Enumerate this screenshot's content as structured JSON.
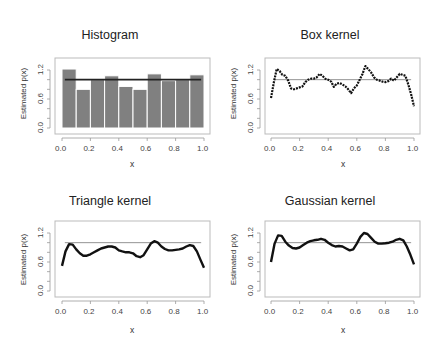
{
  "chart_data": [
    {
      "type": "bar",
      "title": "Histogram",
      "xlabel": "x",
      "ylabel": "Estimated p(x)",
      "xlim": [
        0.0,
        1.0
      ],
      "ylim": [
        0.0,
        1.4
      ],
      "xticks": [
        "0.0",
        "0.2",
        "0.4",
        "0.6",
        "0.8",
        "1.0"
      ],
      "yticks": [
        "0.0",
        "0.6",
        "1.2"
      ],
      "bin_edges": [
        0.0,
        0.1,
        0.2,
        0.3,
        0.4,
        0.5,
        0.6,
        0.7,
        0.8,
        0.9,
        1.0
      ],
      "values": [
        1.22,
        0.8,
        1.0,
        1.08,
        0.86,
        0.8,
        1.12,
        0.98,
        1.0,
        1.1
      ],
      "reference_line": 1.0,
      "bar_color": "#808080",
      "grid": false
    },
    {
      "type": "line",
      "title": "Box kernel",
      "xlabel": "x",
      "ylabel": "Estimated p(x)",
      "xlim": [
        0.0,
        1.0
      ],
      "ylim": [
        0.0,
        1.4
      ],
      "xticks": [
        "0.0",
        "0.2",
        "0.4",
        "0.6",
        "0.8",
        "1.0"
      ],
      "yticks": [
        "0.0",
        "0.6",
        "1.2"
      ],
      "reference_line": 1.0,
      "x": [
        0.0,
        0.02,
        0.04,
        0.06,
        0.08,
        0.1,
        0.12,
        0.14,
        0.16,
        0.18,
        0.2,
        0.22,
        0.24,
        0.26,
        0.28,
        0.3,
        0.32,
        0.34,
        0.36,
        0.38,
        0.4,
        0.42,
        0.44,
        0.46,
        0.48,
        0.5,
        0.52,
        0.54,
        0.56,
        0.58,
        0.6,
        0.62,
        0.64,
        0.66,
        0.68,
        0.7,
        0.72,
        0.74,
        0.76,
        0.78,
        0.8,
        0.82,
        0.84,
        0.86,
        0.88,
        0.9,
        0.92,
        0.94,
        0.96,
        0.98,
        1.0
      ],
      "values": [
        0.62,
        0.95,
        1.22,
        1.18,
        1.1,
        1.08,
        0.98,
        0.82,
        0.8,
        0.82,
        0.84,
        0.86,
        0.95,
        1.0,
        1.02,
        1.02,
        1.05,
        1.12,
        1.08,
        1.02,
        1.0,
        0.96,
        0.85,
        0.92,
        0.93,
        0.9,
        0.86,
        0.8,
        0.72,
        0.82,
        0.88,
        1.0,
        1.12,
        1.28,
        1.22,
        1.15,
        1.05,
        1.0,
        0.98,
        0.96,
        0.95,
        0.97,
        1.02,
        0.98,
        1.05,
        1.12,
        1.1,
        1.08,
        0.9,
        0.7,
        0.45
      ],
      "line_style": "dotted-thick",
      "grid": false
    },
    {
      "type": "line",
      "title": "Triangle kernel",
      "xlabel": "x",
      "ylabel": "Estimated p(x)",
      "xlim": [
        0.0,
        1.0
      ],
      "ylim": [
        0.0,
        1.4
      ],
      "xticks": [
        "0.0",
        "0.2",
        "0.4",
        "0.6",
        "0.8",
        "1.0"
      ],
      "yticks": [
        "0.0",
        "0.6",
        "1.2"
      ],
      "reference_line": 1.0,
      "x": [
        0.0,
        0.025,
        0.05,
        0.075,
        0.1,
        0.125,
        0.15,
        0.175,
        0.2,
        0.225,
        0.25,
        0.275,
        0.3,
        0.325,
        0.35,
        0.375,
        0.4,
        0.425,
        0.45,
        0.475,
        0.5,
        0.525,
        0.55,
        0.575,
        0.6,
        0.625,
        0.65,
        0.675,
        0.7,
        0.725,
        0.75,
        0.775,
        0.8,
        0.825,
        0.85,
        0.875,
        0.9,
        0.925,
        0.95,
        0.975,
        1.0
      ],
      "values": [
        0.52,
        0.82,
        0.97,
        0.96,
        0.86,
        0.78,
        0.73,
        0.73,
        0.76,
        0.8,
        0.84,
        0.88,
        0.9,
        0.92,
        0.92,
        0.9,
        0.84,
        0.82,
        0.8,
        0.8,
        0.78,
        0.72,
        0.7,
        0.74,
        0.86,
        0.98,
        1.03,
        1.0,
        0.92,
        0.87,
        0.84,
        0.84,
        0.85,
        0.86,
        0.88,
        0.92,
        0.95,
        0.93,
        0.82,
        0.65,
        0.48
      ],
      "line_style": "solid-thick",
      "grid": false
    },
    {
      "type": "line",
      "title": "Gaussian kernel",
      "xlabel": "x",
      "ylabel": "Estimated p(x)",
      "xlim": [
        0.0,
        1.0
      ],
      "ylim": [
        0.0,
        1.4
      ],
      "xticks": [
        "0.0",
        "0.2",
        "0.4",
        "0.6",
        "0.8",
        "1.0"
      ],
      "yticks": [
        "0.0",
        "0.6",
        "1.2"
      ],
      "reference_line": 1.0,
      "x": [
        0.0,
        0.025,
        0.05,
        0.075,
        0.1,
        0.125,
        0.15,
        0.175,
        0.2,
        0.225,
        0.25,
        0.275,
        0.3,
        0.325,
        0.35,
        0.375,
        0.4,
        0.425,
        0.45,
        0.475,
        0.5,
        0.525,
        0.55,
        0.575,
        0.6,
        0.625,
        0.65,
        0.675,
        0.7,
        0.725,
        0.75,
        0.775,
        0.8,
        0.825,
        0.85,
        0.875,
        0.9,
        0.925,
        0.95,
        0.975,
        1.0
      ],
      "values": [
        0.6,
        0.98,
        1.15,
        1.14,
        1.02,
        0.94,
        0.89,
        0.88,
        0.9,
        0.95,
        1.0,
        1.03,
        1.05,
        1.06,
        1.08,
        1.06,
        1.0,
        0.95,
        0.92,
        0.93,
        0.92,
        0.88,
        0.84,
        0.86,
        0.98,
        1.12,
        1.2,
        1.18,
        1.1,
        1.02,
        0.98,
        0.98,
        0.99,
        1.0,
        1.02,
        1.06,
        1.08,
        1.05,
        0.92,
        0.75,
        0.55
      ],
      "line_style": "solid-thick",
      "grid": false
    }
  ]
}
